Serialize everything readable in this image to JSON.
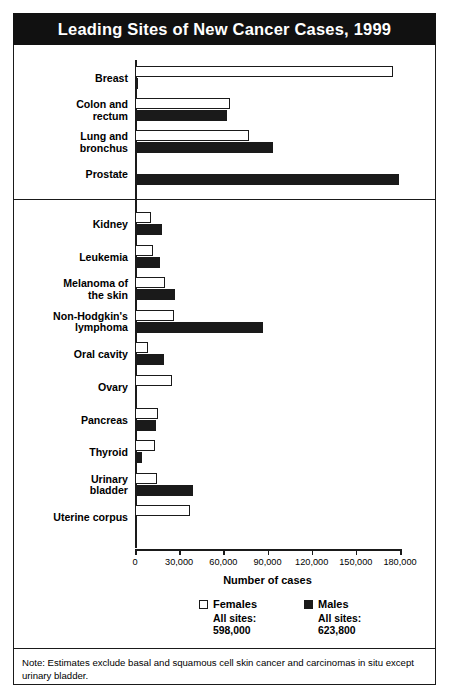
{
  "title": "Leading Sites of New Cancer Cases, 1999",
  "note": "Note: Estimates exclude basal and squamous cell skin cancer and carcinomas in situ except urinary bladder.",
  "axis": {
    "title": "Number of cases",
    "ticks": [
      "0",
      "30,000",
      "60,000",
      "90,000",
      "120,000",
      "150,000",
      "180,000"
    ]
  },
  "legend": {
    "female": {
      "name": "Females",
      "all_sites_label": "All sites:",
      "all_sites_value": "598,000",
      "color": "#ffffff"
    },
    "male": {
      "name": "Males",
      "all_sites_label": "All sites:",
      "all_sites_value": "623,800",
      "color": "#1a1a1a"
    }
  },
  "chart_data": {
    "type": "bar",
    "orientation": "horizontal",
    "title": "Leading Sites of New Cancer Cases, 1999",
    "xlabel": "Number of cases",
    "ylabel": "",
    "xlim": [
      0,
      180000
    ],
    "xticks": [
      0,
      30000,
      60000,
      90000,
      120000,
      150000,
      180000
    ],
    "grid": false,
    "legend_position": "bottom",
    "series": [
      {
        "name": "Females",
        "color": "#ffffff",
        "values": [
          175000,
          64800,
          77600,
          0,
          11000,
          12400,
          20400,
          26300,
          9000,
          25200,
          15900,
          13500,
          15200,
          37400
        ]
      },
      {
        "name": "Males",
        "color": "#1a1a1a",
        "values": [
          1300,
          62400,
          94000,
          179300,
          18000,
          16800,
          27300,
          87100,
          20000,
          0,
          14600,
          4600,
          39100,
          0
        ]
      }
    ],
    "categories": [
      "Breast",
      "Colon and rectum",
      "Lung and bronchus",
      "Prostate",
      "Kidney",
      "Leukemia",
      "Melanoma of the skin",
      "Non-Hodgkin's lymphoma",
      "Oral cavity",
      "Ovary",
      "Pancreas",
      "Thyroid",
      "Urinary bladder",
      "Uterine corpus"
    ],
    "groups": [
      {
        "name": "top",
        "rows": [
          {
            "label_line1": "Breast",
            "label_line2": "",
            "female": 175000,
            "male": 1300
          },
          {
            "label_line1": "Colon and",
            "label_line2": "rectum",
            "female": 64800,
            "male": 62400
          },
          {
            "label_line1": "Lung and",
            "label_line2": "bronchus",
            "female": 77600,
            "male": 94000
          },
          {
            "label_line1": "Prostate",
            "label_line2": "",
            "female": 0,
            "male": 179300
          }
        ]
      },
      {
        "name": "bottom",
        "rows": [
          {
            "label_line1": "Kidney",
            "label_line2": "",
            "female": 11000,
            "male": 18000
          },
          {
            "label_line1": "Leukemia",
            "label_line2": "",
            "female": 12400,
            "male": 16800
          },
          {
            "label_line1": "Melanoma of",
            "label_line2": "the skin",
            "female": 20400,
            "male": 27300
          },
          {
            "label_line1": "Non-Hodgkin's",
            "label_line2": "lymphoma",
            "female": 26300,
            "male": 87100
          },
          {
            "label_line1": "Oral cavity",
            "label_line2": "",
            "female": 9000,
            "male": 20000
          },
          {
            "label_line1": "Ovary",
            "label_line2": "",
            "female": 25200,
            "male": 0
          },
          {
            "label_line1": "Pancreas",
            "label_line2": "",
            "female": 15900,
            "male": 14600
          },
          {
            "label_line1": "Thyroid",
            "label_line2": "",
            "female": 13500,
            "male": 4600
          },
          {
            "label_line1": "Urinary",
            "label_line2": "bladder",
            "female": 15200,
            "male": 39100
          },
          {
            "label_line1": "Uterine corpus",
            "label_line2": "",
            "female": 37400,
            "male": 0
          }
        ]
      }
    ]
  }
}
